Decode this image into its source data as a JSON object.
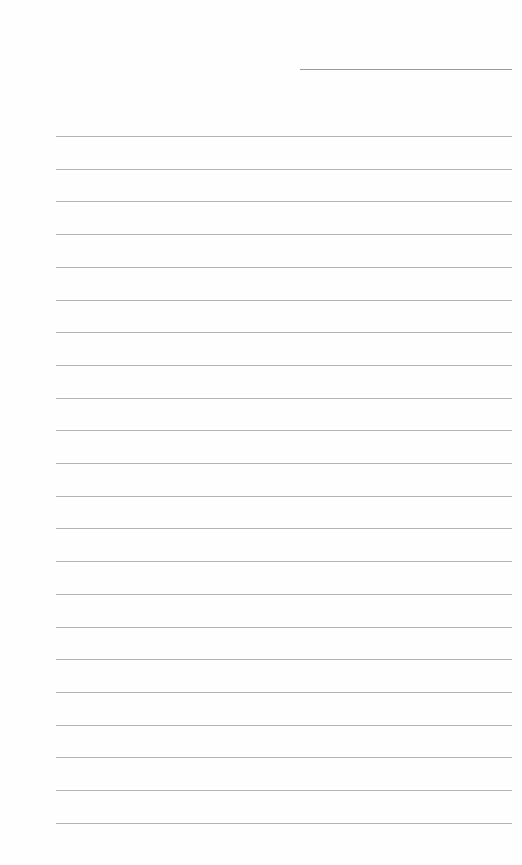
{
  "page": {
    "type": "blank-lined-paper",
    "background_color": "#fefefe",
    "line_color": "#b4b4b4",
    "date_line": {
      "present": true
    },
    "ruled_lines": {
      "count": 22,
      "first_y": 136,
      "spacing": 32.7
    }
  }
}
